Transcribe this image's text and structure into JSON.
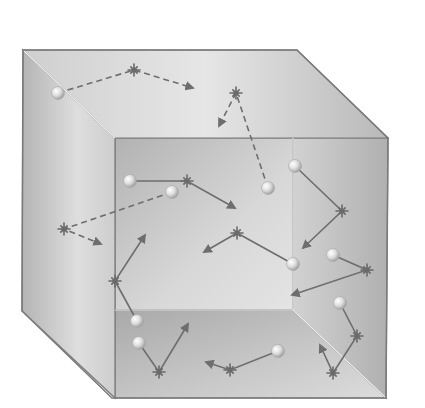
{
  "diagram": {
    "colors": {
      "background": "#ffffff",
      "edge": "#7a7a7a",
      "inner_edge": "#f2f2f2",
      "path": "#6e6e6e",
      "star": "#6a6a6a",
      "ball_light": "#fbfbfb",
      "ball_dark": "#9a9a9a"
    },
    "box": {
      "top_face": [
        [
          23,
          50
        ],
        [
          297,
          50
        ],
        [
          388,
          138
        ],
        [
          115,
          138
        ]
      ],
      "left_face": [
        [
          23,
          50
        ],
        [
          115,
          138
        ],
        [
          115,
          398
        ],
        [
          22,
          311
        ]
      ],
      "back_wall": [
        [
          115,
          138
        ],
        [
          293,
          138
        ],
        [
          293,
          310
        ],
        [
          115,
          310
        ]
      ],
      "right_wall": [
        [
          293,
          138
        ],
        [
          388,
          138
        ],
        [
          386,
          398
        ],
        [
          293,
          310
        ]
      ],
      "floor": [
        [
          115,
          310
        ],
        [
          293,
          310
        ],
        [
          386,
          398
        ],
        [
          115,
          398
        ]
      ]
    },
    "molecules": [
      {
        "ball": [
          58,
          93
        ],
        "points": [
          [
            58,
            93
          ],
          [
            134,
            70
          ],
          [
            193,
            88
          ]
        ],
        "style": "dashed"
      },
      {
        "ball": [
          268,
          188
        ],
        "points": [
          [
            268,
            188
          ],
          [
            236,
            93
          ],
          [
            219,
            126
          ]
        ],
        "style": "dashed"
      },
      {
        "ball": [
          130,
          181
        ],
        "points": [
          [
            130,
            181
          ],
          [
            187,
            181
          ],
          [
            235,
            208
          ]
        ],
        "style": "solid"
      },
      {
        "ball": [
          172,
          192
        ],
        "points": [
          [
            172,
            192
          ],
          [
            64,
            229
          ],
          [
            101,
            244
          ]
        ],
        "style": "dashed"
      },
      {
        "ball": [
          295,
          166
        ],
        "points": [
          [
            295,
            166
          ],
          [
            342,
            211
          ],
          [
            303,
            248
          ]
        ],
        "style": "solid"
      },
      {
        "ball": [
          293,
          264
        ],
        "points": [
          [
            293,
            264
          ],
          [
            237,
            233
          ],
          [
            204,
            252
          ]
        ],
        "style": "solid"
      },
      {
        "ball": [
          333,
          255
        ],
        "points": [
          [
            333,
            255
          ],
          [
            367,
            270
          ],
          [
            292,
            295
          ]
        ],
        "style": "solid"
      },
      {
        "ball": [
          137,
          321
        ],
        "points": [
          [
            137,
            321
          ],
          [
            115,
            281
          ],
          [
            145,
            235
          ]
        ],
        "style": "solid"
      },
      {
        "ball": [
          139,
          343
        ],
        "points": [
          [
            139,
            343
          ],
          [
            159,
            372
          ],
          [
            188,
            324
          ]
        ],
        "style": "solid"
      },
      {
        "ball": [
          278,
          351
        ],
        "points": [
          [
            278,
            351
          ],
          [
            230,
            370
          ],
          [
            206,
            362
          ]
        ],
        "style": "solid"
      },
      {
        "ball": [
          340,
          303
        ],
        "points": [
          [
            340,
            303
          ],
          [
            357,
            336
          ],
          [
            333,
            373
          ],
          [
            320,
            345
          ]
        ],
        "style": "solid"
      }
    ]
  }
}
